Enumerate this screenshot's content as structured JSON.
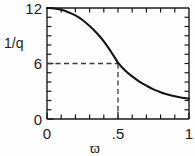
{
  "chart_data": {
    "type": "line",
    "title": "",
    "subtitle": "",
    "xlabel": "ϖ",
    "ylabel": "1/q",
    "xlim": [
      0,
      1
    ],
    "ylim": [
      0,
      12
    ],
    "grid": false,
    "legend": null,
    "x_ticks": [
      0,
      0.1,
      0.2,
      0.3,
      0.4,
      0.5,
      0.6,
      0.7,
      0.8,
      0.9,
      1
    ],
    "x_tick_labels": [
      "0",
      "",
      "",
      "",
      "",
      ".5",
      "",
      "",
      "",
      "",
      "1"
    ],
    "x_major_ticks": [
      0,
      0.5,
      1
    ],
    "y_ticks": [
      0,
      1,
      2,
      3,
      4,
      5,
      6,
      7,
      8,
      9,
      10,
      11,
      12
    ],
    "y_tick_labels": [
      "0",
      "",
      "",
      "",
      "",
      "",
      "6",
      "",
      "",
      "",
      "",
      "",
      "12"
    ],
    "y_major_ticks": [
      0,
      6,
      12
    ],
    "series": [
      {
        "name": "1/q vs ϖ",
        "x": [
          0.0,
          0.05,
          0.1,
          0.15,
          0.2,
          0.25,
          0.3,
          0.35,
          0.4,
          0.45,
          0.5,
          0.55,
          0.6,
          0.65,
          0.7,
          0.75,
          0.8,
          0.85,
          0.9,
          0.95,
          1.0
        ],
        "y": [
          12.0,
          11.95,
          11.8,
          11.55,
          11.2,
          10.7,
          10.05,
          9.3,
          8.4,
          7.3,
          6.1,
          5.25,
          4.6,
          4.05,
          3.6,
          3.2,
          2.9,
          2.65,
          2.45,
          2.3,
          2.2
        ]
      }
    ],
    "annotations": [
      {
        "name": "guide-horizontal",
        "type": "dashed-line",
        "orientation": "horizontal",
        "y": 6,
        "x_from": 0,
        "x_to": 0.5
      },
      {
        "name": "guide-vertical",
        "type": "dashed-line",
        "orientation": "vertical",
        "x": 0.5,
        "y_from": 0,
        "y_to": 6
      }
    ],
    "reference_point": {
      "x": 0.5,
      "y": 6
    },
    "colors": {
      "curve": "#141414",
      "axis": "#1a1a1a",
      "guide": "#3a3a3a",
      "background": "#fefefe"
    }
  },
  "labels": {
    "y_axis_title": "1/q",
    "x_axis_title": "ϖ",
    "y_top": "12",
    "y_mid": "6",
    "y_bottom": "0",
    "x_left": "0",
    "x_mid": ".5",
    "x_right": "1"
  }
}
